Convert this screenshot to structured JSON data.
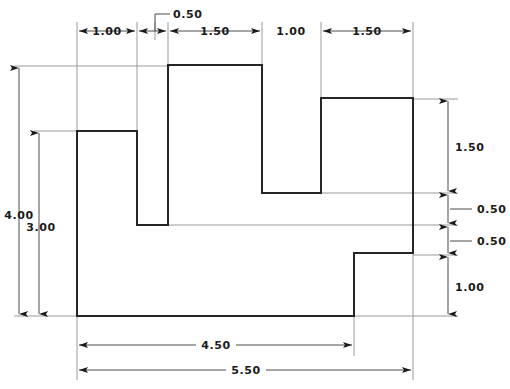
{
  "drawing": {
    "title": "Orthographic front view with stepped profile",
    "units": "inches",
    "line_color": "#262626",
    "dimension_color": "#4a4a4a",
    "extension_color": "#9a9a9a",
    "text_color": "#1a1a1a",
    "background_color": "#ffffff"
  },
  "horizontal_dimensions": [
    {
      "id": "h-1-00-a",
      "label": "1.00",
      "value": 1.0,
      "from_x": 77,
      "to_x": 137,
      "line_y": 31,
      "arrows": "both",
      "text_x": 107,
      "text_y": 35
    },
    {
      "id": "h-0-50",
      "label": "0.50",
      "value": 0.5,
      "from_x": 137,
      "to_x": 168,
      "line_y": 31,
      "arrows": "both-outside",
      "text_x": 177,
      "text_y": 17
    },
    {
      "id": "h-1-50-a",
      "label": "1.50",
      "value": 1.5,
      "from_x": 168,
      "to_x": 262,
      "line_y": 31,
      "arrows": "both",
      "text_x": 215,
      "text_y": 35
    },
    {
      "id": "h-1-00-b",
      "label": "1.00",
      "value": 1.0,
      "from_x": 262,
      "to_x": 321,
      "line_y": 31,
      "arrows": "none",
      "text_x": 291,
      "text_y": 35
    },
    {
      "id": "h-1-50-b",
      "label": "1.50",
      "value": 1.5,
      "from_x": 321,
      "to_x": 413,
      "line_y": 31,
      "arrows": "both",
      "text_x": 367,
      "text_y": 35
    }
  ],
  "vertical_dimensions_left": [
    {
      "id": "v-4-00",
      "label": "4.00",
      "value": 4.0,
      "line_x": 19,
      "from_y": 66,
      "to_y": 316,
      "text_x": 19,
      "text_y": 219
    },
    {
      "id": "v-3-00",
      "label": "3.00",
      "value": 3.0,
      "line_x": 39,
      "from_y": 131,
      "to_y": 316,
      "text_x": 39,
      "text_y": 231
    }
  ],
  "vertical_dimensions_right": [
    {
      "id": "v-1-50",
      "label": "1.50",
      "value": 1.5,
      "line_x": 448,
      "from_y": 99,
      "to_y": 193,
      "text_x": 455,
      "text_y": 151,
      "placement": "inside"
    },
    {
      "id": "v-0-50-a",
      "label": "0.50",
      "value": 0.5,
      "line_x": 448,
      "from_y": 193,
      "to_y": 225,
      "text_x": 478,
      "text_y": 209,
      "placement": "leader-right"
    },
    {
      "id": "v-0-50-b",
      "label": "0.50",
      "value": 0.5,
      "line_x": 448,
      "from_y": 225,
      "to_y": 255,
      "text_x": 478,
      "text_y": 241,
      "placement": "leader-right"
    },
    {
      "id": "v-1-00",
      "label": "1.00",
      "value": 1.0,
      "line_x": 448,
      "from_y": 255,
      "to_y": 316,
      "text_x": 455,
      "text_y": 288,
      "placement": "inside"
    }
  ],
  "bottom_dimensions": [
    {
      "id": "b-4-50",
      "label": "4.50",
      "value": 4.5,
      "from_x": 77,
      "to_x": 354,
      "line_y": 345,
      "text_x": 215,
      "text_y": 349
    },
    {
      "id": "b-5-50",
      "label": "5.50",
      "value": 5.5,
      "from_x": 77,
      "to_x": 413,
      "line_y": 370,
      "text_x": 245,
      "text_y": 374
    }
  ],
  "profile": {
    "name": "stepped-part-outline",
    "points": "77,131 137,131 137,225 168,225 168,65 262,65 262,193 321,193 321,98 413,98 413,253 354,253 354,316 77,316 77,131"
  },
  "extension_lines_vertical": [
    {
      "x": 77,
      "y1": 22,
      "y2": 131
    },
    {
      "x": 137,
      "y1": 22,
      "y2": 131
    },
    {
      "x": 155,
      "y1": 22,
      "y2": 40
    },
    {
      "x": 168,
      "y1": 22,
      "y2": 65
    },
    {
      "x": 262,
      "y1": 22,
      "y2": 65
    },
    {
      "x": 321,
      "y1": 22,
      "y2": 98
    },
    {
      "x": 413,
      "y1": 22,
      "y2": 98
    },
    {
      "x": 77,
      "y1": 316,
      "y2": 380
    },
    {
      "x": 354,
      "y1": 253,
      "y2": 356
    },
    {
      "x": 413,
      "y1": 253,
      "y2": 380
    }
  ],
  "extension_lines_horizontal": [
    {
      "y": 66,
      "x1": 14,
      "x2": 170
    },
    {
      "y": 131,
      "x1": 34,
      "x2": 79
    },
    {
      "y": 316,
      "x1": 14,
      "x2": 79
    },
    {
      "y": 99,
      "x1": 413,
      "x2": 458
    },
    {
      "y": 193,
      "x1": 321,
      "x2": 458
    },
    {
      "y": 225,
      "x1": 137,
      "x2": 458
    },
    {
      "y": 255,
      "x1": 413,
      "x2": 458
    },
    {
      "y": 316,
      "x1": 354,
      "x2": 458
    }
  ],
  "leader_lines": [
    {
      "id": "leader-0-50-top",
      "points": "155,31 155,14 170,14"
    },
    {
      "id": "leader-0-50-mid-a",
      "points": "448,209 474,209"
    },
    {
      "id": "leader-0-50-mid-b",
      "points": "448,241 474,241"
    }
  ]
}
